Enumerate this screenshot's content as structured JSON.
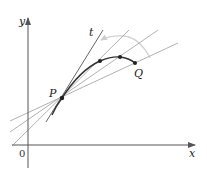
{
  "diagram": {
    "labels": {
      "y_axis": "y",
      "x_axis": "x",
      "origin": "0",
      "point_p": "P",
      "point_q": "Q",
      "tangent": "t"
    },
    "colors": {
      "axis": "#555555",
      "curve": "#333333",
      "tangent": "#555555",
      "secant": "#aaaaaa",
      "arc": "#d0d0d0",
      "point": "#222222"
    },
    "points": {
      "P": [
        62,
        98
      ],
      "Q": [
        135,
        63
      ],
      "Q2": [
        120,
        57
      ],
      "Q3": [
        100,
        61
      ]
    }
  }
}
